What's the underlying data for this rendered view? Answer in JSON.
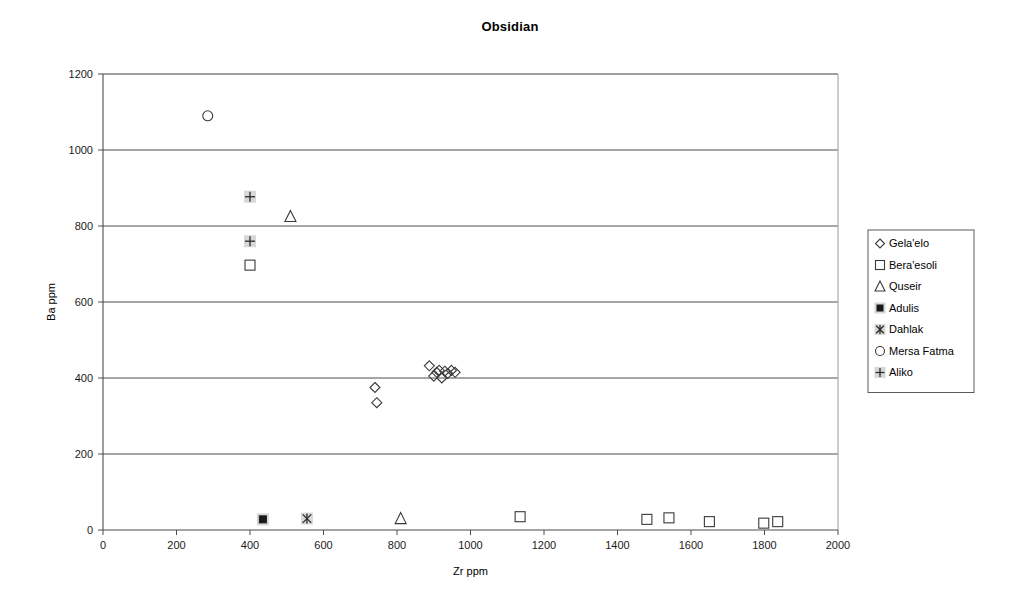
{
  "chart_data": {
    "type": "scatter",
    "title": "Obsidian",
    "xlabel": "Zr ppm",
    "ylabel": "Ba ppm",
    "xlim": [
      0,
      2000
    ],
    "ylim": [
      0,
      1200
    ],
    "xticks": [
      0,
      200,
      400,
      600,
      800,
      1000,
      1200,
      1400,
      1600,
      1800,
      2000
    ],
    "yticks": [
      0,
      200,
      400,
      600,
      800,
      1000,
      1200
    ],
    "grid": "horizontal",
    "legend_position": "right",
    "series": [
      {
        "name": "Gela'elo",
        "marker": "diamond-open",
        "points": [
          [
            740,
            375
          ],
          [
            745,
            335
          ],
          [
            888,
            432
          ],
          [
            900,
            405
          ],
          [
            908,
            415
          ],
          [
            915,
            420
          ],
          [
            922,
            400
          ],
          [
            930,
            418
          ],
          [
            938,
            412
          ],
          [
            948,
            420
          ],
          [
            958,
            415
          ]
        ]
      },
      {
        "name": "Bera'esoli",
        "marker": "square-open",
        "points": [
          [
            400,
            697
          ],
          [
            1135,
            35
          ],
          [
            1480,
            28
          ],
          [
            1540,
            32
          ],
          [
            1650,
            22
          ],
          [
            1798,
            18
          ],
          [
            1836,
            22
          ]
        ]
      },
      {
        "name": "Quseir",
        "marker": "triangle-open",
        "points": [
          [
            510,
            825
          ],
          [
            810,
            30
          ]
        ]
      },
      {
        "name": "Adulis",
        "marker": "square-filled",
        "points": [
          [
            435,
            28
          ]
        ]
      },
      {
        "name": "Dahlak",
        "marker": "asterisk",
        "points": [
          [
            555,
            30
          ]
        ]
      },
      {
        "name": "Mersa Fatma",
        "marker": "circle-open",
        "points": [
          [
            285,
            1090
          ]
        ]
      },
      {
        "name": "Aliko",
        "marker": "plus",
        "points": [
          [
            400,
            877
          ],
          [
            400,
            760
          ]
        ]
      }
    ]
  },
  "colors": {
    "marker_stroke": "#3a3a3a",
    "marker_fill_dark": "#1a1a1a",
    "marker_backing": "#d8d8d8",
    "gridline": "#4d4d4d",
    "frame": "#9a9a9a",
    "background": "#ffffff"
  }
}
